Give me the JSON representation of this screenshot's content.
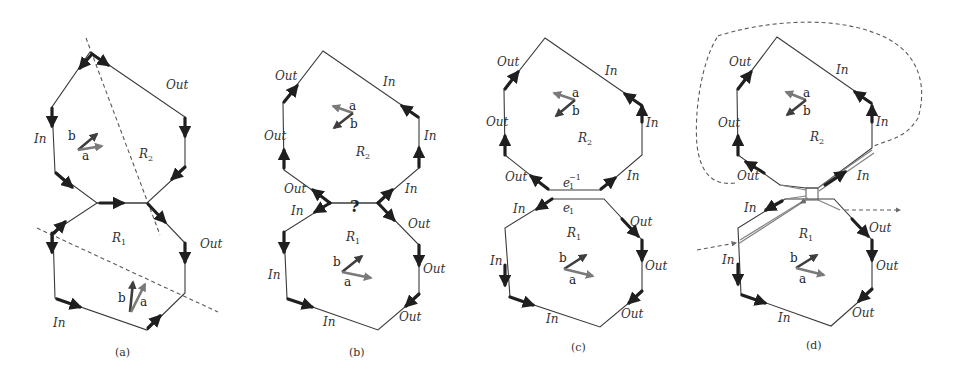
{
  "figure": {
    "panels": [
      {
        "caption": "(a)",
        "regions": [
          {
            "name": "R",
            "sub": "2"
          },
          {
            "name": "R",
            "sub": "1"
          }
        ],
        "labels": [
          "Out",
          "In",
          "Out",
          "In"
        ],
        "vectors": [
          {
            "label": "a"
          },
          {
            "label": "b"
          },
          {
            "label": "a"
          },
          {
            "label": "b"
          }
        ]
      },
      {
        "caption": "(b)",
        "regions": [
          {
            "name": "R",
            "sub": "2"
          },
          {
            "name": "R",
            "sub": "1"
          }
        ],
        "labels": [
          "Out",
          "Out",
          "Out",
          "In",
          "In",
          "In",
          "In",
          "Out",
          "In",
          "Out",
          "In",
          "Out",
          "In",
          "Out"
        ],
        "junction_mark": "?",
        "vectors": [
          {
            "label": "a"
          },
          {
            "label": "b"
          },
          {
            "label": "a"
          },
          {
            "label": "b"
          }
        ]
      },
      {
        "caption": "(c)",
        "regions": [
          {
            "name": "R",
            "sub": "2"
          },
          {
            "name": "R",
            "sub": "1"
          }
        ],
        "labels": [
          "Out",
          "Out",
          "Out",
          "In",
          "In",
          "In",
          "In",
          "Out",
          "In",
          "Out",
          "In",
          "Out"
        ],
        "edge_labels": [
          {
            "base": "e",
            "sub": "1",
            "sup": "−1"
          },
          {
            "base": "e",
            "sub": "1"
          }
        ],
        "vectors": [
          {
            "label": "a"
          },
          {
            "label": "b"
          },
          {
            "label": "a"
          },
          {
            "label": "b"
          }
        ]
      },
      {
        "caption": "(d)",
        "regions": [
          {
            "name": "R",
            "sub": "2"
          },
          {
            "name": "R",
            "sub": "1"
          }
        ],
        "labels": [
          "Out",
          "Out",
          "Out",
          "In",
          "In",
          "In",
          "In",
          "Out",
          "In",
          "Out",
          "In",
          "Out"
        ],
        "vectors": [
          {
            "label": "a"
          },
          {
            "label": "b"
          },
          {
            "label": "a"
          },
          {
            "label": "b"
          }
        ]
      }
    ]
  },
  "text": {
    "out": "Out",
    "in": "In",
    "R": "R",
    "one": "1",
    "two": "2",
    "a": "a",
    "b": "b",
    "q": "?",
    "e": "e",
    "inv": "−1",
    "cap_a": "(a)",
    "cap_b": "(b)",
    "cap_c": "(c)",
    "cap_d": "(d)"
  },
  "colors": {
    "edge": "#3a3a3a",
    "thick_arrow": "#1f1f1f",
    "vector_a": "#7a7a7a",
    "vector_b": "#3e3e3e",
    "dashed": "#5a5a5a",
    "background": "#ffffff"
  }
}
